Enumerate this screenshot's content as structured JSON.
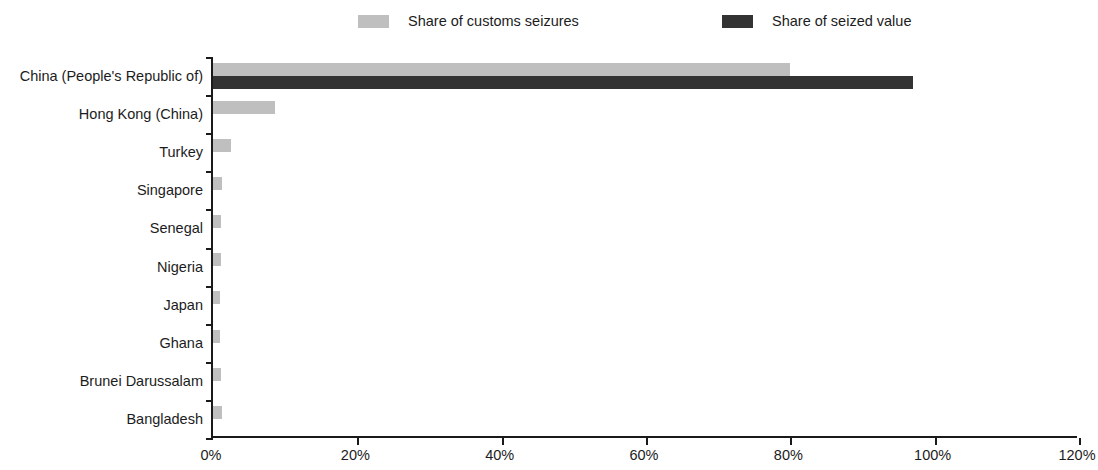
{
  "chart_data": {
    "type": "bar",
    "orientation": "horizontal",
    "title": "",
    "subtitle": "",
    "xlabel": "",
    "ylabel": "",
    "xlim": [
      0,
      120
    ],
    "xtick_labels": [
      "0%",
      "20%",
      "40%",
      "60%",
      "80%",
      "100%",
      "120%"
    ],
    "xtick_values": [
      0,
      20,
      40,
      60,
      80,
      100,
      120
    ],
    "grid": false,
    "legend_position": "top",
    "categories": [
      "China (People's Republic of)",
      "Hong Kong (China)",
      "Turkey",
      "Singapore",
      "Senegal",
      "Nigeria",
      "Japan",
      "Ghana",
      "Brunei Darussalam",
      "Bangladesh"
    ],
    "series": [
      {
        "name": "Share of customs seizures",
        "color": "#bfbfbf",
        "values": [
          80.0,
          8.6,
          2.5,
          1.2,
          1.1,
          1.1,
          1.0,
          1.0,
          1.1,
          1.2
        ]
      },
      {
        "name": "Share of seized value",
        "color": "#333333",
        "values": [
          97.0,
          0.0,
          0.0,
          0.0,
          0.0,
          0.0,
          0.0,
          0.0,
          0.0,
          0.0
        ]
      }
    ]
  },
  "legend": {
    "entries": [
      {
        "label": "Share of customs seizures",
        "color": "#bfbfbf"
      },
      {
        "label": "Share of seized value",
        "color": "#333333"
      }
    ]
  },
  "axis": {
    "value_axis_ticks": [
      "0%",
      "20%",
      "40%",
      "60%",
      "80%",
      "100%",
      "120%"
    ],
    "category_axis_labels": [
      "China (People's Republic of)",
      "Hong Kong (China)",
      "Turkey",
      "Singapore",
      "Senegal",
      "Nigeria",
      "Japan",
      "Ghana",
      "Brunei Darussalam",
      "Bangladesh"
    ]
  },
  "colors": {
    "series_light": "#bfbfbf",
    "series_dark": "#333333",
    "axis": "#1a1a1a",
    "text": "#1c1c1c",
    "background": "#ffffff"
  }
}
